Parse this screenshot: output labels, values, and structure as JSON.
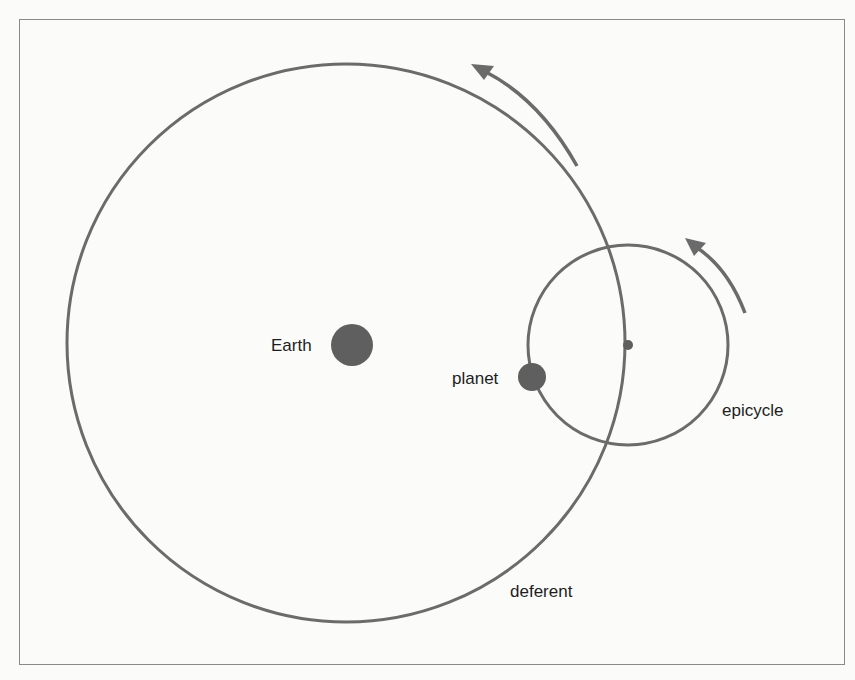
{
  "diagram": {
    "type": "Ptolemaic epicycle model",
    "labels": {
      "earth": "Earth",
      "planet": "planet",
      "epicycle": "epicycle",
      "deferent": "deferent"
    },
    "colors": {
      "line": "#6b6b6b",
      "body": "#5f5f5f",
      "frame": "#8a8a8a",
      "text": "#1e1e1e",
      "background": "#fbfbf9"
    },
    "elements": {
      "deferent": {
        "cx": 346,
        "cy": 343,
        "r": 279
      },
      "epicycle": {
        "cx": 628,
        "cy": 345,
        "r": 100
      },
      "earth": {
        "cx": 352,
        "cy": 345,
        "r": 21
      },
      "planet": {
        "cx": 532,
        "cy": 377,
        "r": 14
      },
      "epicycle_center": {
        "cx": 628,
        "cy": 345,
        "r": 5
      }
    },
    "arrows": [
      {
        "name": "deferent-direction-arrow",
        "direction": "counterclockwise"
      },
      {
        "name": "epicycle-direction-arrow",
        "direction": "counterclockwise"
      }
    ]
  }
}
